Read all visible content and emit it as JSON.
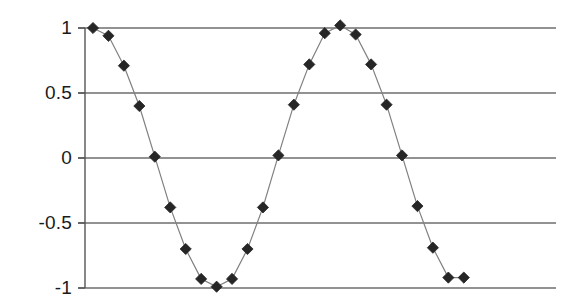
{
  "chart_data": {
    "type": "line",
    "title": "",
    "subtitle": "",
    "xlabel": "",
    "ylabel": "",
    "legend": [],
    "legend_position": "none",
    "grid": "horizontal",
    "xlim": [
      0,
      30
    ],
    "ylim": [
      -1,
      1
    ],
    "yticks": [
      1,
      0.5,
      0,
      -0.5,
      -1
    ],
    "ytick_labels": [
      "1",
      "0.5",
      "0",
      "-0.5",
      "-1"
    ],
    "xticks": [],
    "xtick_labels": [],
    "marker": "diamond",
    "marker_color": "#262626",
    "line_color": "#808080",
    "axis_color": "#555555",
    "grid_color": "#6e6e6e",
    "series": [
      {
        "name": "sine",
        "x": [
          0,
          1,
          2,
          3,
          4,
          5,
          6,
          7,
          8,
          9,
          10,
          11,
          12,
          13,
          14,
          15,
          16,
          17,
          18,
          19,
          20,
          21,
          22,
          23,
          24
        ],
        "values": [
          1.0,
          0.94,
          0.71,
          0.4,
          0.01,
          -0.38,
          -0.7,
          -0.93,
          -0.99,
          -0.93,
          -0.7,
          -0.38,
          0.02,
          0.41,
          0.72,
          0.96,
          1.02,
          0.95,
          0.72,
          0.41,
          0.02,
          -0.37,
          -0.69,
          -0.92,
          -0.92
        ]
      }
    ]
  },
  "axis": {
    "y_axis_name": "y-axis",
    "x_axis_name": "x-axis"
  }
}
